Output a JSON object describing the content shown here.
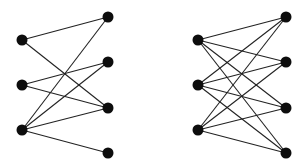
{
  "diagram": {
    "background": "#ffffff",
    "edge_color": "#222222",
    "node_color": "#0d0d0d",
    "node_radius": 5.5,
    "graphs": [
      {
        "name": "partial-bipartite-graph",
        "nodes": [
          {
            "id": "a1",
            "x": 22,
            "y": 40
          },
          {
            "id": "a2",
            "x": 22,
            "y": 85
          },
          {
            "id": "a3",
            "x": 22,
            "y": 130
          },
          {
            "id": "b1",
            "x": 108,
            "y": 17
          },
          {
            "id": "b2",
            "x": 108,
            "y": 62
          },
          {
            "id": "b3",
            "x": 108,
            "y": 108
          },
          {
            "id": "b4",
            "x": 108,
            "y": 153
          }
        ],
        "edges": [
          [
            "a1",
            "b1"
          ],
          [
            "a1",
            "b3"
          ],
          [
            "a2",
            "b2"
          ],
          [
            "a2",
            "b3"
          ],
          [
            "a3",
            "b1"
          ],
          [
            "a3",
            "b2"
          ],
          [
            "a3",
            "b3"
          ],
          [
            "a3",
            "b4"
          ]
        ]
      },
      {
        "name": "complete-bipartite-graph-k34",
        "nodes": [
          {
            "id": "c1",
            "x": 198,
            "y": 40
          },
          {
            "id": "c2",
            "x": 198,
            "y": 85
          },
          {
            "id": "c3",
            "x": 198,
            "y": 130
          },
          {
            "id": "d1",
            "x": 286,
            "y": 17
          },
          {
            "id": "d2",
            "x": 286,
            "y": 62
          },
          {
            "id": "d3",
            "x": 286,
            "y": 108
          },
          {
            "id": "d4",
            "x": 286,
            "y": 153
          }
        ],
        "edges": [
          [
            "c1",
            "d1"
          ],
          [
            "c1",
            "d2"
          ],
          [
            "c1",
            "d3"
          ],
          [
            "c1",
            "d4"
          ],
          [
            "c2",
            "d1"
          ],
          [
            "c2",
            "d2"
          ],
          [
            "c2",
            "d3"
          ],
          [
            "c2",
            "d4"
          ],
          [
            "c3",
            "d1"
          ],
          [
            "c3",
            "d2"
          ],
          [
            "c3",
            "d3"
          ],
          [
            "c3",
            "d4"
          ]
        ]
      }
    ]
  }
}
